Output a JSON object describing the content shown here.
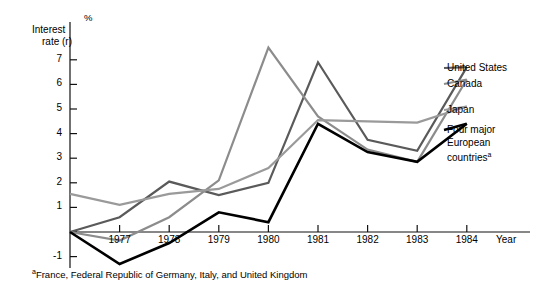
{
  "chart_data": {
    "type": "line",
    "title": "",
    "xlabel": "Year",
    "ylabel": "Interest rate (r)",
    "yunit": "%",
    "x": [
      1976,
      1977,
      1978,
      1979,
      1980,
      1981,
      1982,
      1983,
      1984
    ],
    "xtick_labels": [
      "1977",
      "1978",
      "1979",
      "1980",
      "1981",
      "1982",
      "1983",
      "1984"
    ],
    "xtick_values": [
      1977,
      1978,
      1979,
      1980,
      1981,
      1982,
      1983,
      1984
    ],
    "ytick_labels": [
      "7",
      "6",
      "5",
      "4",
      "3",
      "2",
      "1",
      "0",
      "-1"
    ],
    "ytick_values": [
      7,
      6,
      5,
      4,
      3,
      2,
      1,
      0,
      -1
    ],
    "ylim": [
      -1.6,
      7.8
    ],
    "xlim": [
      1976,
      1985.4
    ],
    "grid": false,
    "legend_position": "right",
    "series": [
      {
        "name": "United States",
        "color": "#5a5a5a",
        "width": 2.2,
        "values": [
          0.0,
          0.6,
          2.05,
          1.5,
          2.0,
          6.9,
          3.75,
          3.3,
          6.7
        ]
      },
      {
        "name": "Canada",
        "color": "#8c8c8c",
        "width": 2.2,
        "values": [
          0.0,
          -0.35,
          0.6,
          2.1,
          7.5,
          4.7,
          3.35,
          2.85,
          6.2
        ]
      },
      {
        "name": "Japan",
        "color": "#9a9a9a",
        "width": 2.2,
        "values": [
          1.55,
          1.1,
          1.55,
          1.75,
          2.6,
          4.55,
          4.5,
          4.45,
          5.1
        ]
      },
      {
        "name": "Four major European countries",
        "name_display": "Four major\nEuropean\ncountries",
        "footnote_marker": "a",
        "color": "#000000",
        "width": 2.6,
        "values": [
          0.0,
          -1.3,
          -0.45,
          0.8,
          0.4,
          4.4,
          3.25,
          2.85,
          4.4
        ]
      }
    ],
    "footnote": "France, Federal Republic of Germany, Italy, and United Kingdom",
    "footnote_marker": "a"
  },
  "legend": {
    "items": [
      {
        "label": "United States"
      },
      {
        "label": "Canada"
      },
      {
        "label": "Japan"
      },
      {
        "label_line1": "Four major",
        "label_line2": "European",
        "label_line3": "countries",
        "marker": "a"
      }
    ]
  }
}
